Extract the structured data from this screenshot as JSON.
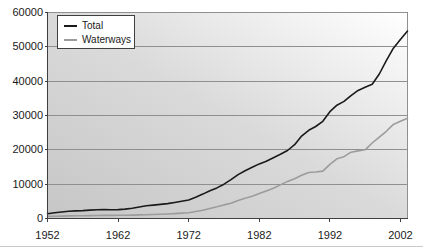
{
  "chart_data": {
    "type": "line",
    "title": "",
    "xlabel": "",
    "ylabel": "",
    "grid": "horizontal",
    "plot_background": {
      "from": "#c6c6c6",
      "mid": "#dadada",
      "to": "#ffffff"
    },
    "gridline_color": "#8f8f8f",
    "axis_color": "#3f3f3f",
    "xlim": [
      1952,
      2003
    ],
    "ylim": [
      0,
      60000
    ],
    "x_ticks": [
      1952,
      1962,
      1972,
      1982,
      1992,
      2002
    ],
    "x_tick_labels": [
      "1952",
      "1962",
      "1972",
      "1982",
      "1992",
      "2002"
    ],
    "y_ticks": [
      0,
      10000,
      20000,
      30000,
      40000,
      50000,
      60000
    ],
    "y_tick_labels": [
      "0",
      "10000",
      "20000",
      "30000",
      "40000",
      "50000",
      "60000"
    ],
    "legend_position": "top-left",
    "years": [
      1952,
      1953,
      1954,
      1955,
      1956,
      1957,
      1958,
      1959,
      1960,
      1961,
      1962,
      1963,
      1964,
      1965,
      1966,
      1967,
      1968,
      1969,
      1970,
      1971,
      1972,
      1973,
      1974,
      1975,
      1976,
      1977,
      1978,
      1979,
      1980,
      1981,
      1982,
      1983,
      1984,
      1985,
      1986,
      1987,
      1988,
      1989,
      1990,
      1991,
      1992,
      1993,
      1994,
      1995,
      1996,
      1997,
      1998,
      1999,
      2000,
      2001,
      2002,
      2003
    ],
    "series": [
      {
        "name": "Total",
        "color": "#1a1a1a",
        "values": [
          1400,
          1700,
          1900,
          2100,
          2200,
          2300,
          2450,
          2550,
          2600,
          2550,
          2600,
          2750,
          3000,
          3350,
          3700,
          3900,
          4100,
          4350,
          4650,
          5000,
          5400,
          6200,
          7100,
          8100,
          8900,
          10000,
          11300,
          12800,
          13900,
          14900,
          15900,
          16700,
          17700,
          18700,
          19800,
          21500,
          24000,
          25700,
          26800,
          28300,
          31100,
          33000,
          34100,
          35800,
          37300,
          38200,
          39100,
          42100,
          46000,
          49600,
          52100,
          54600
        ]
      },
      {
        "name": "Waterways",
        "color": "#9c9c9c",
        "values": [
          600,
          650,
          700,
          750,
          800,
          820,
          850,
          880,
          900,
          900,
          930,
          960,
          1000,
          1060,
          1120,
          1170,
          1230,
          1320,
          1430,
          1560,
          1700,
          2050,
          2400,
          2900,
          3400,
          3950,
          4450,
          5250,
          5900,
          6500,
          7250,
          8050,
          8800,
          9800,
          10800,
          11600,
          12600,
          13400,
          13550,
          13800,
          15800,
          17400,
          18000,
          19300,
          19700,
          20000,
          22000,
          23700,
          25400,
          27400,
          28300,
          29200
        ]
      }
    ]
  }
}
